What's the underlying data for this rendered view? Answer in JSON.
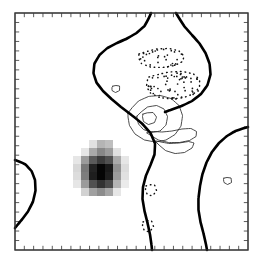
{
  "figure": {
    "name": "contour-map-with-shading",
    "background_color": "#ffffff",
    "frame_color": "#3a3a3a",
    "axis": {
      "x_tick_count": 25,
      "y_tick_count": 25,
      "x_tick_labels": [],
      "y_tick_labels": [],
      "title": "",
      "xlabel": "",
      "ylabel": ""
    }
  },
  "chart_data": {
    "type": "heatmap",
    "title": "",
    "subtitle": "",
    "xlabel": "",
    "ylabel": "",
    "xlim": [
      0,
      24
    ],
    "ylim": [
      0,
      24
    ],
    "grid": false,
    "legend": "none",
    "colors": {
      "thick_contour": "#000000",
      "thin_contour": "#2b2b2b",
      "dotted_contour": "#111111",
      "shading_dark": "#111111",
      "shading_mid": "#6f6f6f",
      "shading_light": "#c9c9c9"
    },
    "contour_styles": [
      {
        "name": "thick-solid",
        "meaning": "zero / primary contour",
        "line_width": 2.6,
        "dash": "solid"
      },
      {
        "name": "thin-solid",
        "meaning": "positive contour",
        "line_width": 0.85,
        "dash": "solid"
      },
      {
        "name": "dotted",
        "meaning": "negative contour",
        "line_width": 1.45,
        "dash": "dotted"
      }
    ],
    "shaded_patch": {
      "name": "significance-shading",
      "cell_size": 8,
      "origin": [
        73,
        140
      ],
      "grid_rows": 7,
      "grid_cols": 7,
      "values": [
        [
          0.0,
          0.0,
          0.12,
          0.3,
          0.26,
          0.0,
          0.0
        ],
        [
          0.0,
          0.1,
          0.34,
          0.48,
          0.4,
          0.12,
          0.0
        ],
        [
          0.1,
          0.4,
          0.66,
          0.78,
          0.7,
          0.34,
          0.1
        ],
        [
          0.16,
          0.54,
          0.88,
          1.0,
          0.92,
          0.44,
          0.14
        ],
        [
          0.14,
          0.52,
          0.9,
          1.0,
          0.9,
          0.4,
          0.12
        ],
        [
          0.1,
          0.4,
          0.7,
          0.82,
          0.72,
          0.3,
          0.08
        ],
        [
          0.0,
          0.18,
          0.38,
          0.46,
          0.36,
          0.1,
          0.0
        ]
      ]
    },
    "thick_contour_paths": [
      {
        "name": "upper-central-lobe",
        "points": "151,13 148,22 141,30 132,36 122,41 112,45 103,51 96,59 93,68 94,78 99,87 107,95 116,103 126,111 137,119 147,128 154,138 156,149 153,160 148,170 144,181 142,193 143,205 146,217 149,229 151,240 152,250"
      },
      {
        "name": "top-right-branch",
        "points": "176,13 181,22 188,31 196,39 203,48 208,58 211,69 210,80 205,90 197,98 187,104 176,108 165,112"
      },
      {
        "name": "right-edge-arc",
        "points": "248,127 240,129 231,133 223,139 215,147 209,157 204,168 201,180 199,192 198,204 199,216 202,228 205,239 207,250"
      },
      {
        "name": "left-edge-bulge",
        "points": "15,160 22,162 29,167 34,175 36,185 35,196 31,207 25,216 19,223 15,228"
      }
    ],
    "thin_contour_paths": [
      {
        "name": "outer-positive-loop",
        "points": "128,113 134,104 143,98 154,95 166,96 176,101 182,110 183,121 179,131 171,138 161,142 150,142 139,138 131,130 128,121 128,113"
      },
      {
        "name": "mid-positive-loop",
        "points": "137,116 143,109 152,105 161,106 167,112 168,121 164,129 156,133 147,132 140,127 137,121 137,116"
      },
      {
        "name": "inner-positive-loop",
        "points": "143,114 150,111 156,114 157,120 152,125 145,124 142,119 143,114"
      },
      {
        "name": "lower-positive-lobe",
        "points": "147,133 154,138 163,142 174,143 185,142 194,139 198,134 195,129 187,128 177,130 167,132 157,132 150,131 147,133"
      },
      {
        "name": "lower-right-tail",
        "points": "155,141 161,148 170,153 180,154 189,151 195,145 193,141 184,142 174,144 164,143 158,141 155,141"
      },
      {
        "name": "small-diamond-left",
        "points": "113,86 118,84 121,88 118,93 113,92 111,89 113,86"
      },
      {
        "name": "small-loop-right-edge",
        "points": "224,178 229,176 233,180 230,185 225,184 223,181 224,178"
      }
    ],
    "dotted_contour_paths": [
      {
        "name": "upper-elongated-negative-loop",
        "points": "139,54 150,50 163,48 175,49 183,53 185,59 180,64 169,67 156,68 145,66 138,61 139,54"
      },
      {
        "name": "mid-negative-patch-outline",
        "points": "149,77 162,73 176,71 189,72 198,76 201,83 198,91 190,96 178,99 165,99 154,96 147,90 146,83 149,77"
      },
      {
        "name": "bottom-negative-fragment-upper",
        "points": "146,186 152,183 157,187 156,194 150,197 145,193 146,186"
      },
      {
        "name": "bottom-negative-fragment-lower",
        "points": "143,222 149,219 154,223 153,230 147,233 142,229 143,222"
      }
    ],
    "stipple_clusters": [
      {
        "name": "mid-negative-stipple",
        "bbox": [
          147,
          73,
          54,
          26
        ],
        "dot_count": 68
      },
      {
        "name": "upper-negative-stipple",
        "bbox": [
          139,
          49,
          46,
          18
        ],
        "dot_count": 30
      }
    ]
  }
}
